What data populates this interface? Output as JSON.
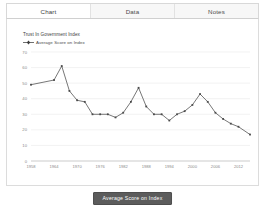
{
  "tabs": [
    {
      "label": "Chart",
      "active": true
    },
    {
      "label": "Data",
      "active": false
    },
    {
      "label": "Notes",
      "active": false
    }
  ],
  "footer": {
    "button_label": "Average Score on Index"
  },
  "colors": {
    "series": "#4a4a4a",
    "grid": "#e9e9e9",
    "axis": "#b5b5b5",
    "button_bg": "#5c5c5c",
    "panel_border": "#dcdcdc"
  },
  "chart_data": {
    "type": "line",
    "title": "Trust In Government Index",
    "xlabel": "",
    "ylabel": "",
    "legend": [
      "Average Score on Index"
    ],
    "legend_position": "top-left",
    "grid": true,
    "ylim": [
      0,
      70
    ],
    "yticks": [
      0,
      10,
      20,
      30,
      40,
      50,
      60,
      70
    ],
    "xlim": [
      1958,
      2015
    ],
    "xticks": [
      1958,
      1964,
      1970,
      1976,
      1982,
      1988,
      1994,
      2000,
      2006,
      2012
    ],
    "xtick_labels": [
      "1958",
      "1964",
      "1970",
      "1976",
      "1982",
      "1988",
      "1994",
      "2000",
      "2006",
      "2012"
    ],
    "series": [
      {
        "name": "Average Score on Index",
        "x": [
          1958,
          1964,
          1966,
          1968,
          1970,
          1972,
          1974,
          1976,
          1978,
          1980,
          1982,
          1984,
          1986,
          1988,
          1990,
          1992,
          1994,
          1996,
          1998,
          2000,
          2002,
          2004,
          2006,
          2008,
          2010,
          2012,
          2015
        ],
        "values": [
          49,
          52,
          61,
          45,
          39,
          38,
          30,
          30,
          30,
          28,
          31,
          38,
          47,
          35,
          30,
          30,
          26,
          30,
          32,
          36,
          43,
          38,
          31,
          27,
          24,
          22,
          17
        ]
      }
    ]
  }
}
